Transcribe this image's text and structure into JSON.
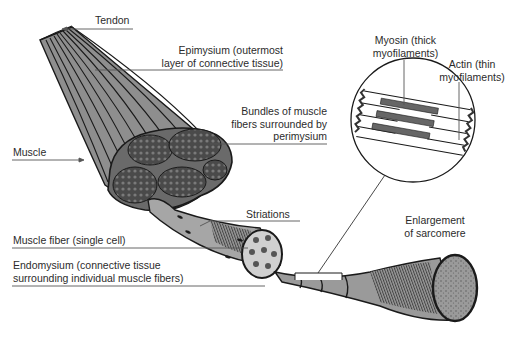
{
  "diagram": {
    "colors": {
      "ink": "#1a1a1a",
      "muscle_fill": "#8c8c8c",
      "muscle_light": "#a8a8a8",
      "bundle_fill": "#5a5a5a",
      "fiber_light": "#c8c8c8",
      "leader_line": "#555555",
      "text": "#2b2b2b"
    },
    "labels": {
      "tendon": "Tendon",
      "epimysium_1": "Epimysium (outermost",
      "epimysium_2": "layer of connective tissue)",
      "bundles_1": "Bundles of muscle",
      "bundles_2": "fibers surrounded by",
      "bundles_3": "perimysium",
      "muscle": "Muscle",
      "striations": "Striations",
      "muscle_fiber": "Muscle fiber (single cell)",
      "endomysium_1": "Endomysium (connective tissue",
      "endomysium_2": "surrounding individual muscle fibers)",
      "myosin_1": "Myosin (thick",
      "myosin_2": "myofilaments)",
      "actin_1": "Actin (thin",
      "actin_2": "myofilaments)",
      "enlargement_1": "Enlargement",
      "enlargement_2": "of sarcomere"
    }
  }
}
